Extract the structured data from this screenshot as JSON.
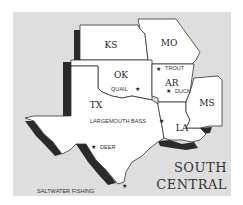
{
  "map": {
    "title_line1": "SOUTH",
    "title_line2": "CENTRAL",
    "states": [
      {
        "abbr": "KS"
      },
      {
        "abbr": "MO"
      },
      {
        "abbr": "OK"
      },
      {
        "abbr": "AR"
      },
      {
        "abbr": "TX"
      },
      {
        "abbr": "LA"
      },
      {
        "abbr": "MS"
      }
    ],
    "markers": [
      {
        "label": "TROUT",
        "icon": "star-icon"
      },
      {
        "label": "QUAIL",
        "icon": "star-icon"
      },
      {
        "label": "DUCK",
        "icon": "star-icon"
      },
      {
        "label": "LARGEMOUTH BASS",
        "icon": "star-icon"
      },
      {
        "label": "DEER",
        "icon": "star-icon"
      },
      {
        "label": "SALTWATER FISHING",
        "icon": "star-icon"
      }
    ],
    "star_glyph": "★",
    "colors": {
      "background": "#dedede",
      "land": "#ffffff",
      "shadow": "#2a2a2a",
      "border": "#333333"
    }
  }
}
